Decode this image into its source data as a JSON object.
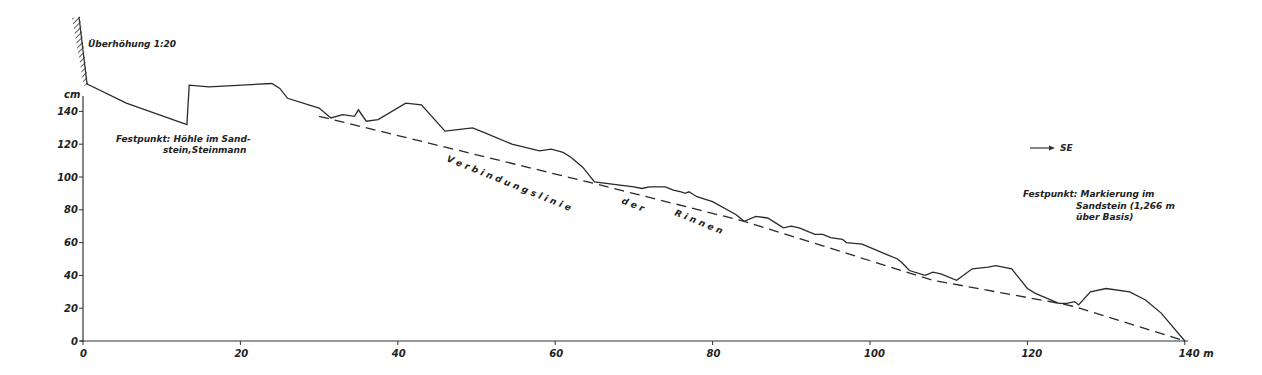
{
  "chart_data": {
    "type": "line",
    "title": "Überhöhung 1:20",
    "xlabel": "m",
    "ylabel": "cm",
    "xlim": [
      0,
      140
    ],
    "ylim": [
      0,
      160
    ],
    "x_ticks": [
      "0",
      "20",
      "40",
      "60",
      "80",
      "100",
      "120",
      "140 m"
    ],
    "y_ticks": [
      "0",
      "20",
      "40",
      "60",
      "80",
      "100",
      "120",
      "140"
    ],
    "y_unit_label": "cm",
    "grid": false,
    "series": [
      {
        "name": "Profil",
        "style": "solid",
        "x": [
          0.4,
          5.5,
          13.2,
          13.5,
          16,
          24,
          25,
          26,
          30,
          31.5,
          33,
          34.5,
          35,
          36,
          37.5,
          41,
          43,
          46,
          49.5,
          51,
          54.5,
          58,
          59.5,
          61,
          62,
          63.5,
          65,
          70,
          71,
          72,
          74,
          75,
          76,
          76.5,
          77,
          78,
          80,
          83,
          84,
          85.5,
          87,
          88,
          89,
          90,
          91,
          93,
          94,
          95,
          96.5,
          97,
          99,
          100.5,
          102,
          103.5,
          104,
          105,
          107,
          108,
          109,
          111,
          113,
          115,
          116,
          118,
          120,
          121,
          124,
          125,
          126,
          126.5,
          128,
          130,
          133,
          135,
          137,
          140
        ],
        "y": [
          157,
          145,
          132,
          156,
          155,
          157,
          154,
          148,
          142,
          136,
          138,
          137,
          141,
          134,
          135,
          145,
          144,
          128,
          130,
          127,
          120,
          116,
          117,
          115,
          112,
          106,
          97,
          94,
          93,
          94,
          94,
          92,
          91,
          90,
          91,
          88,
          85,
          77,
          73,
          76,
          75,
          72,
          69,
          70,
          69,
          65,
          65,
          63,
          62,
          60,
          59,
          56,
          53,
          50,
          48,
          43,
          40,
          42,
          41,
          37,
          44,
          45,
          46,
          44,
          32,
          29,
          23,
          23,
          24,
          22,
          30,
          32,
          30,
          25,
          17,
          0
        ]
      },
      {
        "name": "Verbindungslinie der Rinnen",
        "style": "dashed",
        "x": [
          30,
          65,
          84,
          104,
          108,
          124,
          126,
          140
        ],
        "y": [
          137,
          96,
          73,
          43,
          37,
          23,
          21,
          0
        ]
      }
    ],
    "annotations": [
      {
        "text": "Überhöhung 1:20"
      },
      {
        "text": "Festpunkt: Höhle im Sand-"
      },
      {
        "text": "stein, Steinmann"
      },
      {
        "text": "Verbindungslinie"
      },
      {
        "text": "der"
      },
      {
        "text": "Rinnen"
      },
      {
        "text": "→ SE"
      },
      {
        "text": "Festpunkt: Markierung im"
      },
      {
        "text": "Sandstein (1,266 m"
      },
      {
        "text": "über Basis)"
      }
    ]
  },
  "labels": {
    "exaggeration": "Überhöhung 1:20",
    "y_unit": "cm",
    "fp1_line1": "Festpunkt: Höhle im Sand-",
    "fp1_line2": "stein,Steinmann",
    "link_word1": "V e r b i n d u n g s l i n i e",
    "link_word2": "d e r",
    "link_word3": "R i n n e n",
    "direction": "SE",
    "fp2_line1": "Festpunkt: Markierung im",
    "fp2_line2": "Sandstein (1,266 m",
    "fp2_line3": "über Basis)"
  },
  "ticks": {
    "x": [
      "0",
      "20",
      "40",
      "60",
      "80",
      "100",
      "120",
      "140 m"
    ],
    "y": [
      "0",
      "20",
      "40",
      "60",
      "80",
      "100",
      "120",
      "140"
    ]
  }
}
